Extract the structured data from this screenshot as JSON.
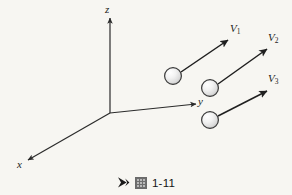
{
  "figure": {
    "background_color": "#f7f6f2",
    "stroke_color": "#2b2b2b",
    "axes": {
      "origin": {
        "x": 110,
        "y": 113
      },
      "items": [
        {
          "name": "z",
          "label": "z",
          "tip": {
            "x": 110,
            "y": 18
          },
          "label_pos": {
            "x": 106,
            "y": 6
          }
        },
        {
          "name": "y",
          "label": "y",
          "tip": {
            "x": 196,
            "y": 104
          },
          "label_pos": {
            "x": 198,
            "y": 99
          }
        },
        {
          "name": "x",
          "label": "x",
          "tip": {
            "x": 27,
            "y": 161
          },
          "label_pos": {
            "x": 18,
            "y": 163
          }
        }
      ]
    },
    "balls": [
      {
        "name": "ball-1",
        "cx": 173,
        "cy": 76,
        "r": 8.5
      },
      {
        "name": "ball-2",
        "cx": 210,
        "cy": 88,
        "r": 8.5
      },
      {
        "name": "ball-3",
        "cx": 210,
        "cy": 120,
        "r": 8.5
      }
    ],
    "vectors": [
      {
        "name": "velocity-vector-1",
        "label": "V",
        "subscript": "1",
        "start": {
          "x": 181,
          "y": 72
        },
        "end": {
          "x": 229,
          "y": 39
        },
        "label_pos": {
          "x": 230,
          "y": 26
        }
      },
      {
        "name": "velocity-vector-2",
        "label": "V",
        "subscript": "2",
        "start": {
          "x": 218,
          "y": 84
        },
        "end": {
          "x": 268,
          "y": 48
        },
        "label_pos": {
          "x": 268,
          "y": 33
        }
      },
      {
        "name": "velocity-vector-3",
        "label": "V",
        "subscript": "3",
        "start": {
          "x": 218,
          "y": 116
        },
        "end": {
          "x": 268,
          "y": 90
        },
        "label_pos": {
          "x": 268,
          "y": 74
        }
      }
    ]
  },
  "caption": {
    "marker_icon": "play-triangle-icon",
    "cjk_glyph_icon": "cjk-figure-glyph-icon",
    "text": "1-11"
  }
}
